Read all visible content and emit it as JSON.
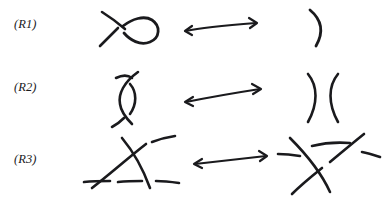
{
  "figure": {
    "background_color": "#ffffff",
    "ink_color": "#1a1a1d",
    "style": "hand-drawn knot diagram sketch",
    "width": 388,
    "height": 218
  },
  "rows": [
    {
      "id": "R1",
      "label": "(R1)",
      "left_diagram": {
        "name": "kinked-strand-with-loop",
        "description": "strand with a single curl forming one self-crossing",
        "crossings": 1
      },
      "relation": {
        "name": "double-headed-arrow",
        "symbol": "⟷",
        "direction": "bidirectional",
        "meaning": "equivalent"
      },
      "right_diagram": {
        "name": "plain-arc-strand",
        "description": "single unknotted arc",
        "crossings": 0
      }
    },
    {
      "id": "R2",
      "label": "(R2)",
      "left_diagram": {
        "name": "two-strands-bigon",
        "description": "two arcs crossing twice forming a bigon",
        "crossings": 2
      },
      "relation": {
        "name": "double-headed-arrow",
        "symbol": "⟷",
        "direction": "bidirectional",
        "meaning": "equivalent"
      },
      "right_diagram": {
        "name": "two-parallel-arcs",
        "description": "two separated arcs facing away",
        "crossings": 0
      }
    },
    {
      "id": "R3",
      "label": "(R3)",
      "left_diagram": {
        "name": "triple-point-strand-below",
        "description": "two slanted strands crossing with a horizontal strand passing below the crossing",
        "crossings": 3
      },
      "relation": {
        "name": "double-headed-arrow",
        "symbol": "⟷",
        "direction": "bidirectional",
        "meaning": "equivalent"
      },
      "right_diagram": {
        "name": "triple-point-strand-above",
        "description": "two slanted strands crossing with a horizontal strand passing above the crossing",
        "crossings": 3
      }
    }
  ]
}
